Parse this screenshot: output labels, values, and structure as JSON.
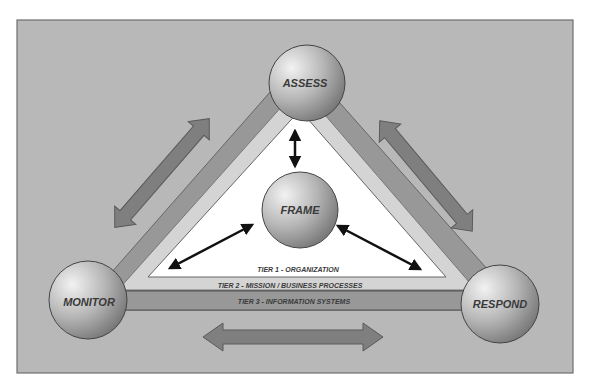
{
  "diagram": {
    "colors": {
      "background": "#b8b8b8",
      "panel_border": "#6e6e6e",
      "tier1_fill": "#ffffff",
      "tier2_fill": "#d6d6d6",
      "tier3_fill": "#989898",
      "arrow_fill": "#7f7f7f",
      "arrow_stroke": "#5a5a5a"
    },
    "nodes": {
      "assess": {
        "label": "ASSESS"
      },
      "frame": {
        "label": "FRAME"
      },
      "monitor": {
        "label": "MONITOR"
      },
      "respond": {
        "label": "RESPOND"
      }
    },
    "tiers": [
      {
        "label": "TIER 1 - ORGANIZATION"
      },
      {
        "label": "TIER 2 - MISSION / BUSINESS PROCESSES"
      },
      {
        "label": "TIER 3 - INFORMATION SYSTEMS"
      }
    ],
    "flows": [
      {
        "from": "ASSESS",
        "to": "MONITOR",
        "type": "bidirectional"
      },
      {
        "from": "ASSESS",
        "to": "RESPOND",
        "type": "bidirectional"
      },
      {
        "from": "MONITOR",
        "to": "RESPOND",
        "type": "bidirectional"
      },
      {
        "from": "FRAME",
        "to": "ASSESS",
        "type": "bidirectional"
      },
      {
        "from": "FRAME",
        "to": "MONITOR",
        "type": "bidirectional"
      },
      {
        "from": "FRAME",
        "to": "RESPOND",
        "type": "bidirectional"
      }
    ]
  }
}
